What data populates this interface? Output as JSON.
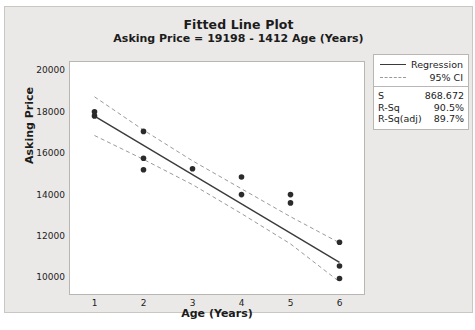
{
  "chart_data": {
    "type": "scatter",
    "title": "Fitted Line Plot",
    "subtitle": "Asking Price = 19198 - 1412 Age (Years)",
    "xlabel": "Age (Years)",
    "ylabel": "Asking Price",
    "xlim": [
      0.5,
      6.5
    ],
    "ylim": [
      9200,
      20400
    ],
    "xticks": [
      1,
      2,
      3,
      4,
      5,
      6
    ],
    "yticks": [
      10000,
      12000,
      14000,
      16000,
      18000,
      20000
    ],
    "grid": false,
    "legend_position": "top-right-outside",
    "points": [
      {
        "x": 1,
        "y": 18000
      },
      {
        "x": 1,
        "y": 17800
      },
      {
        "x": 2,
        "y": 17050
      },
      {
        "x": 2,
        "y": 15750
      },
      {
        "x": 2,
        "y": 15200
      },
      {
        "x": 3,
        "y": 15250
      },
      {
        "x": 4,
        "y": 14850
      },
      {
        "x": 4,
        "y": 14000
      },
      {
        "x": 5,
        "y": 14000
      },
      {
        "x": 5,
        "y": 13600
      },
      {
        "x": 6,
        "y": 11700
      },
      {
        "x": 6,
        "y": 10550
      },
      {
        "x": 6,
        "y": 9950
      }
    ],
    "fit": {
      "intercept": 19198,
      "slope": -1412,
      "x_start": 1,
      "x_end": 6,
      "y_start": 17786,
      "y_end": 10726
    },
    "ci_upper": [
      {
        "x": 1,
        "y": 18720
      },
      {
        "x": 2,
        "y": 17110
      },
      {
        "x": 3,
        "y": 15630
      },
      {
        "x": 4,
        "y": 14280
      },
      {
        "x": 5,
        "y": 12930
      },
      {
        "x": 6,
        "y": 11670
      }
    ],
    "ci_lower": [
      {
        "x": 1,
        "y": 16850
      },
      {
        "x": 2,
        "y": 15700
      },
      {
        "x": 3,
        "y": 14480
      },
      {
        "x": 4,
        "y": 13080
      },
      {
        "x": 5,
        "y": 11620
      },
      {
        "x": 6,
        "y": 9790
      }
    ],
    "series_colors": {
      "points": "#2b2b2b",
      "regression": "#3a3a3a",
      "ci": "#9a9a9a"
    }
  },
  "legend": {
    "items": [
      {
        "label": "Regression",
        "style": "solid"
      },
      {
        "label": "95% CI",
        "style": "dashed"
      }
    ]
  },
  "stats": {
    "rows": [
      {
        "key": "S",
        "value": "868.672"
      },
      {
        "key": "R-Sq",
        "value": "90.5%"
      },
      {
        "key": "R-Sq(adj)",
        "value": "89.7%"
      }
    ]
  }
}
